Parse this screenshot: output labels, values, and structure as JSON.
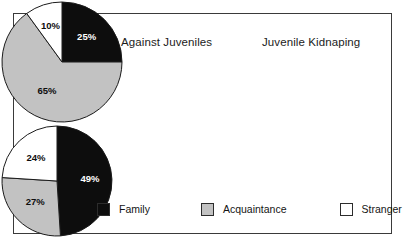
{
  "figure": {
    "background_color": "#ffffff",
    "frame_border_color": "#3a3a3a"
  },
  "colors": {
    "family": "#0d0d0d",
    "acquaintance": "#c2c2c2",
    "stranger": "#ffffff",
    "outline": "#1b1b1b",
    "label_dark": "#0d0d0d",
    "label_light": "#ffffff"
  },
  "legend": {
    "items": [
      {
        "label": "Family",
        "color": "#0d0d0d",
        "swatch": "legend-swatch-family"
      },
      {
        "label": "Acquaintance",
        "color": "#c2c2c2",
        "swatch": "legend-swatch-acquaintance"
      },
      {
        "label": "Stranger",
        "color": "#ffffff",
        "swatch": "legend-swatch-stranger"
      }
    ]
  },
  "charts": {
    "left": {
      "title": "All Violent Crimes Against Juveniles",
      "labels": {
        "family": "25%",
        "acquaintance": "65%",
        "stranger": "10%"
      }
    },
    "right": {
      "title": "Juvenile Kidnaping",
      "labels": {
        "family": "49%",
        "acquaintance": "27%",
        "stranger": "24%"
      }
    }
  },
  "chart_data": [
    {
      "type": "pie",
      "title": "All Violent Crimes Against Juveniles",
      "categories": [
        "Family",
        "Acquaintance",
        "Stranger"
      ],
      "values": [
        25,
        65,
        10
      ],
      "value_labels": [
        "25%",
        "65%",
        "10%"
      ],
      "units": "percent",
      "total": 100,
      "slice_colors": [
        "#0d0d0d",
        "#c2c2c2",
        "#ffffff"
      ],
      "start_angle_deg": 0,
      "direction": "clockwise",
      "legend_position": "bottom",
      "grid": false
    },
    {
      "type": "pie",
      "title": "Juvenile Kidnaping",
      "categories": [
        "Family",
        "Acquaintance",
        "Stranger"
      ],
      "values": [
        49,
        27,
        24
      ],
      "value_labels": [
        "49%",
        "27%",
        "24%"
      ],
      "units": "percent",
      "total": 100,
      "slice_colors": [
        "#0d0d0d",
        "#c2c2c2",
        "#ffffff"
      ],
      "start_angle_deg": 0,
      "direction": "clockwise",
      "legend_position": "bottom",
      "grid": false
    }
  ]
}
